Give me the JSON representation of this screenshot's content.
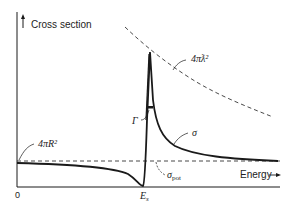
{
  "diagram": {
    "y_axis_label": "Cross section",
    "x_axis_label": "Energy",
    "origin_label": "0",
    "resonance_energy_label": "E",
    "resonance_energy_subscript": "s",
    "labels": {
      "unitarity_limit": "4πƛ²",
      "geometric": "4πR²",
      "width": "Γ",
      "sigma": "σ",
      "sigma_pot": "σ",
      "sigma_pot_subscript": "pot"
    },
    "colors": {
      "ink": "#1a1a1a",
      "background": "#ffffff"
    }
  }
}
